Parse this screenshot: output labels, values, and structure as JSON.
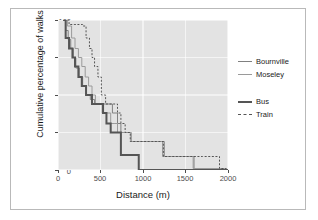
{
  "chart_data": {
    "type": "line",
    "title": "",
    "xlabel": "Distance (m)",
    "ylabel": "Cumulative percentage of walks",
    "xlim": [
      0,
      2000
    ],
    "ylim": [
      0,
      100
    ],
    "xticks": [
      0,
      500,
      1000,
      1500,
      2000
    ],
    "yticks": [
      0,
      25,
      50,
      75,
      100
    ],
    "grid": true,
    "panel_background": "#e3e3e3",
    "gridline_color": "#ffffff",
    "legend_position": "right",
    "legend_groups": [
      {
        "entries": [
          {
            "name": "Bournville",
            "style": "solid",
            "color": "#808080",
            "width": 1
          },
          {
            "name": "Moseley",
            "style": "solid",
            "color": "#9a9a9a",
            "width": 1
          }
        ]
      },
      {
        "entries": [
          {
            "name": "Bus",
            "style": "solid",
            "color": "#555555",
            "width": 2
          },
          {
            "name": "Train",
            "style": "dashed",
            "color": "#555555",
            "width": 1
          }
        ]
      }
    ],
    "series": [
      {
        "name": "Bournville",
        "style": "solid",
        "color": "#808080",
        "width": 1,
        "points": [
          [
            60,
            100
          ],
          [
            90,
            93
          ],
          [
            120,
            87
          ],
          [
            150,
            81
          ],
          [
            180,
            75
          ],
          [
            210,
            68
          ],
          [
            250,
            62
          ],
          [
            290,
            56
          ],
          [
            330,
            50
          ],
          [
            380,
            47
          ],
          [
            430,
            44
          ],
          [
            470,
            44
          ],
          [
            520,
            44
          ],
          [
            560,
            44
          ],
          [
            600,
            44
          ],
          [
            640,
            38
          ],
          [
            700,
            31
          ],
          [
            740,
            25
          ],
          [
            800,
            25
          ],
          [
            860,
            19
          ],
          [
            1000,
            19
          ],
          [
            1150,
            19
          ],
          [
            1250,
            9
          ],
          [
            1400,
            9
          ],
          [
            1580,
            9
          ],
          [
            1600,
            1
          ],
          [
            1800,
            1
          ],
          [
            1950,
            0
          ]
        ]
      },
      {
        "name": "Moseley",
        "style": "solid",
        "color": "#9a9a9a",
        "width": 1,
        "points": [
          [
            70,
            100
          ],
          [
            110,
            96
          ],
          [
            160,
            88
          ],
          [
            200,
            81
          ],
          [
            240,
            75
          ],
          [
            280,
            69
          ],
          [
            320,
            62
          ],
          [
            360,
            56
          ],
          [
            400,
            50
          ],
          [
            440,
            44
          ],
          [
            480,
            44
          ],
          [
            520,
            38
          ],
          [
            570,
            38
          ],
          [
            620,
            31
          ],
          [
            660,
            31
          ],
          [
            700,
            25
          ],
          [
            760,
            25
          ],
          [
            830,
            25
          ],
          [
            860,
            19
          ],
          [
            950,
            19
          ],
          [
            1100,
            19
          ],
          [
            1230,
            9
          ],
          [
            1400,
            9
          ],
          [
            1560,
            9
          ],
          [
            1590,
            1
          ],
          [
            1800,
            1
          ],
          [
            1960,
            0
          ]
        ]
      },
      {
        "name": "Bus",
        "style": "solid",
        "color": "#555555",
        "width": 2,
        "points": [
          [
            60,
            100
          ],
          [
            90,
            88
          ],
          [
            130,
            81
          ],
          [
            170,
            75
          ],
          [
            200,
            69
          ],
          [
            240,
            62
          ],
          [
            280,
            56
          ],
          [
            330,
            50
          ],
          [
            370,
            50
          ],
          [
            400,
            44
          ],
          [
            450,
            44
          ],
          [
            490,
            44
          ],
          [
            530,
            38
          ],
          [
            570,
            31
          ],
          [
            620,
            25
          ],
          [
            680,
            25
          ],
          [
            720,
            25
          ],
          [
            740,
            10
          ],
          [
            800,
            10
          ],
          [
            880,
            10
          ],
          [
            950,
            0
          ],
          [
            1200,
            0
          ],
          [
            1600,
            0
          ],
          [
            2000,
            0
          ]
        ]
      },
      {
        "name": "Train",
        "style": "dashed",
        "color": "#555555",
        "width": 1,
        "points": [
          [
            70,
            100
          ],
          [
            130,
            97
          ],
          [
            190,
            97
          ],
          [
            250,
            97
          ],
          [
            290,
            96
          ],
          [
            330,
            88
          ],
          [
            370,
            81
          ],
          [
            400,
            75
          ],
          [
            430,
            69
          ],
          [
            470,
            62
          ],
          [
            510,
            50
          ],
          [
            560,
            44
          ],
          [
            600,
            44
          ],
          [
            640,
            44
          ],
          [
            680,
            44
          ],
          [
            700,
            38
          ],
          [
            740,
            31
          ],
          [
            790,
            25
          ],
          [
            850,
            19
          ],
          [
            950,
            19
          ],
          [
            1100,
            19
          ],
          [
            1240,
            9
          ],
          [
            1450,
            9
          ],
          [
            1700,
            9
          ],
          [
            1880,
            9
          ],
          [
            1900,
            1
          ],
          [
            1980,
            0
          ]
        ]
      }
    ]
  },
  "axes": {
    "y_tick_labels": [
      "100",
      "75",
      "50",
      "25",
      "0"
    ],
    "x_tick_labels": [
      "0",
      "500",
      "1000",
      "1500",
      "2000"
    ],
    "y_title": "Cumulative percentage of walks",
    "x_title": "Distance (m)"
  },
  "legend": {
    "group1": [
      {
        "label": "Bournville"
      },
      {
        "label": "Moseley"
      }
    ],
    "group2": [
      {
        "label": "Bus"
      },
      {
        "label": "Train"
      }
    ]
  }
}
